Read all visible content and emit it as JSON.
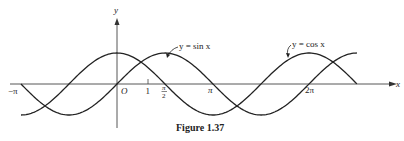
{
  "figure": {
    "caption": "Figure 1.37",
    "axis_x_label": "x",
    "axis_y_label": "y",
    "origin_label": "O",
    "ticks": {
      "neg_pi": "−π",
      "one": "1",
      "pi_over_2_num": "π",
      "pi_over_2_den": "2",
      "pi": "π",
      "two_pi": "2π"
    },
    "curves": [
      {
        "name": "sin",
        "label": "y = sin x",
        "color": "#222222"
      },
      {
        "name": "cos",
        "label": "y = cos x",
        "color": "#222222"
      }
    ]
  },
  "chart_data": {
    "type": "line",
    "title": "Figure 1.37",
    "xlabel": "x",
    "ylabel": "y",
    "xlim": [
      -3.14159,
      7.85
    ],
    "ylim": [
      -1,
      1
    ],
    "x_ticks": [
      "−π",
      "O",
      "1",
      "π/2",
      "π",
      "2π"
    ],
    "series": [
      {
        "name": "y = sin x",
        "function": "sin(x)",
        "x_range": [
          -3.14159,
          7.85
        ]
      },
      {
        "name": "y = cos x",
        "function": "cos(x)",
        "x_range": [
          -3.14159,
          7.85
        ]
      }
    ],
    "grid": false,
    "legend": "inline labels with arrows"
  }
}
